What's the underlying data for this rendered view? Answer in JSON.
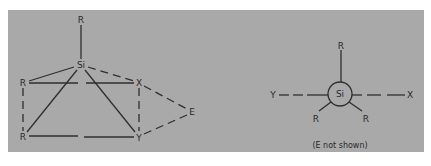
{
  "colors": {
    "page_background": "#ffffff",
    "panel_background": "#a9a9a9",
    "line": "#2f2f2f",
    "text": "#2a2a2a"
  },
  "left_diagram": {
    "description": "Trigonal bipyramidal transition state with Si center",
    "atoms": {
      "r_top": {
        "label": "R",
        "x": 81,
        "y": 20
      },
      "si": {
        "label": "Si",
        "x": 81,
        "y": 65
      },
      "r_left_upper": {
        "label": "R",
        "x": 23,
        "y": 83
      },
      "x": {
        "label": "X",
        "x": 139,
        "y": 83
      },
      "e": {
        "label": "E",
        "x": 192,
        "y": 112
      },
      "r_left_lower": {
        "label": "R",
        "x": 23,
        "y": 137
      },
      "y": {
        "label": "Y",
        "x": 139,
        "y": 137
      }
    },
    "solid_bonds": [
      [
        "r_top",
        "si"
      ],
      [
        "si",
        "r_left_upper"
      ],
      [
        "si",
        "r_left_lower"
      ],
      [
        "si",
        "y"
      ]
    ],
    "dashed_bonds": [
      [
        "si",
        "x"
      ],
      [
        "r_left_upper",
        "r_left_lower"
      ],
      [
        "x",
        "y"
      ],
      [
        "x",
        "e"
      ],
      [
        "e",
        "y"
      ]
    ],
    "broken_edges": [
      [
        "r_left_upper",
        "x"
      ],
      [
        "r_left_lower",
        "y"
      ]
    ]
  },
  "right_diagram": {
    "description": "Newman-style projection along Y-Si-X axis",
    "center": {
      "label": "Si",
      "x": 340,
      "y": 94,
      "radius": 12
    },
    "substituents": [
      {
        "label": "R",
        "x": 341,
        "y": 46,
        "position": "top"
      },
      {
        "label": "R",
        "x": 316,
        "y": 119,
        "position": "lower-left"
      },
      {
        "label": "R",
        "x": 366,
        "y": 119,
        "position": "lower-right"
      },
      {
        "label": "Y",
        "x": 273,
        "y": 95,
        "position": "left"
      },
      {
        "label": "X",
        "x": 410,
        "y": 95,
        "position": "right"
      }
    ],
    "caption": "(E not shown)"
  }
}
